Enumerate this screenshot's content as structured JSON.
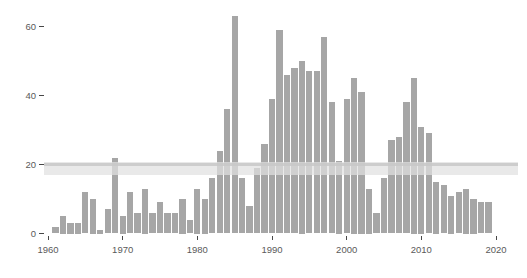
{
  "chart_data": {
    "type": "bar",
    "title": "",
    "xlabel": "",
    "ylabel": "",
    "x": [
      1961,
      1962,
      1963,
      1964,
      1965,
      1966,
      1967,
      1968,
      1969,
      1970,
      1971,
      1972,
      1973,
      1974,
      1975,
      1976,
      1977,
      1978,
      1979,
      1980,
      1981,
      1982,
      1983,
      1984,
      1985,
      1986,
      1987,
      1988,
      1989,
      1990,
      1991,
      1992,
      1993,
      1994,
      1995,
      1996,
      1997,
      1998,
      1999,
      2000,
      2001,
      2002,
      2003,
      2004,
      2005,
      2006,
      2007,
      2008,
      2009,
      2010,
      2011,
      2012,
      2013,
      2014,
      2015,
      2016,
      2017,
      2018,
      2019
    ],
    "values": [
      2,
      5,
      3,
      3,
      12,
      10,
      1,
      7,
      22,
      5,
      12,
      6,
      13,
      6,
      9,
      6,
      6,
      10,
      4,
      13,
      10,
      16,
      24,
      36,
      63,
      16,
      8,
      19,
      26,
      39,
      59,
      46,
      48,
      50,
      47,
      47,
      57,
      38,
      21,
      39,
      45,
      41,
      13,
      6,
      16,
      27,
      28,
      38,
      45,
      31,
      29,
      15,
      14,
      11,
      12,
      13,
      10,
      9,
      9
    ],
    "x_tick_labels": [
      "1960",
      "1970",
      "1980",
      "1990",
      "2000",
      "2010",
      "2020"
    ],
    "x_tick_values": [
      1960,
      1970,
      1980,
      1990,
      2000,
      2010,
      2020
    ],
    "y_tick_labels": [
      "0",
      "20",
      "40",
      "60"
    ],
    "y_tick_values": [
      0,
      20,
      40,
      60
    ],
    "xlim": [
      1959.5,
      2020.5
    ],
    "ylim": [
      0,
      65
    ],
    "grid": "off",
    "legend": "none",
    "highlight_band": {
      "ymin": 17,
      "ymax": 20.6,
      "gridline_y": 20
    },
    "colors": {
      "bar_fill": "#a6a6a6",
      "band_fill": "rgba(225,225,225,0.72)",
      "band_line": "rgba(200,200,200,0.85)",
      "axis_text": "#5a5a5a",
      "tick_mark": "#474747",
      "background": "#ffffff"
    }
  }
}
